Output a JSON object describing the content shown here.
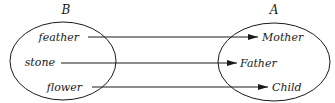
{
  "diagram": {
    "sets": [
      {
        "label": "B",
        "elements": [
          "feather",
          "stone",
          "flower"
        ]
      },
      {
        "label": "A",
        "elements": [
          "Mother",
          "Father",
          "Child"
        ]
      }
    ],
    "mappings": [
      {
        "from": "feather",
        "to": "Mother"
      },
      {
        "from": "stone",
        "to": "Father"
      },
      {
        "from": "flower",
        "to": "Child"
      }
    ]
  }
}
